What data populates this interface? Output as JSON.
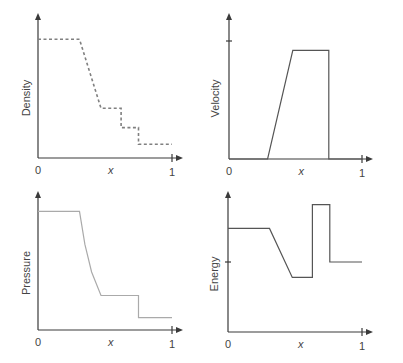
{
  "chart_data": [
    {
      "type": "line",
      "title": "",
      "xlabel": "x",
      "ylabel": "Density",
      "x_tick_labels": [
        "0",
        "1"
      ],
      "xlim": [
        0,
        1
      ],
      "ylim": [
        0,
        1
      ],
      "line_style": "dashed",
      "series": [
        {
          "name": "Density",
          "x": [
            0,
            0.31,
            0.47,
            0.62,
            0.62,
            0.75,
            0.75,
            1.0
          ],
          "y": [
            0.86,
            0.86,
            0.36,
            0.36,
            0.22,
            0.22,
            0.1,
            0.1
          ]
        }
      ]
    },
    {
      "type": "line",
      "title": "",
      "xlabel": "x",
      "ylabel": "Velocity",
      "x_tick_labels": [
        "0",
        "1"
      ],
      "xlim": [
        0,
        1
      ],
      "ylim": [
        0,
        1
      ],
      "y_ticks": [
        1
      ],
      "line_style": "solid",
      "series": [
        {
          "name": "Velocity",
          "x": [
            0,
            0.29,
            0.48,
            0.75,
            0.75,
            1.0
          ],
          "y": [
            0,
            0,
            0.92,
            0.92,
            0,
            0
          ]
        }
      ]
    },
    {
      "type": "line",
      "title": "",
      "xlabel": "x",
      "ylabel": "Pressure",
      "x_tick_labels": [
        "0",
        "1"
      ],
      "xlim": [
        0,
        1
      ],
      "ylim": [
        0,
        1
      ],
      "line_style": "solid-light",
      "series": [
        {
          "name": "Pressure",
          "x": [
            0,
            0.31,
            0.35,
            0.4,
            0.47,
            0.75,
            0.75,
            1.0
          ],
          "y": [
            0.86,
            0.86,
            0.62,
            0.42,
            0.25,
            0.25,
            0.09,
            0.09
          ]
        }
      ]
    },
    {
      "type": "line",
      "title": "",
      "xlabel": "x",
      "ylabel": "Energy",
      "x_tick_labels": [
        "0",
        "1"
      ],
      "xlim": [
        0,
        1
      ],
      "ylim": [
        0,
        1
      ],
      "y_ticks": [
        0.5
      ],
      "line_style": "solid",
      "series": [
        {
          "name": "Energy",
          "x": [
            0,
            0.31,
            0.48,
            0.63,
            0.63,
            0.76,
            0.76,
            1.0
          ],
          "y": [
            0.74,
            0.74,
            0.39,
            0.39,
            0.91,
            0.91,
            0.5,
            0.5
          ]
        }
      ]
    }
  ]
}
